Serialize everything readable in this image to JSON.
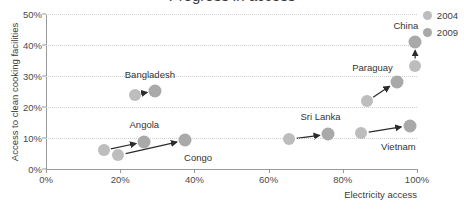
{
  "chart_data": {
    "type": "scatter",
    "title": "Progress in access",
    "xlabel": "Electricity access",
    "ylabel": "Access to clean cooking facilities",
    "xlim": [
      0,
      100
    ],
    "ylim": [
      0,
      50
    ],
    "xticks": [
      "0%",
      "20%",
      "40%",
      "60%",
      "80%",
      "100%"
    ],
    "xtick_values": [
      0,
      20,
      40,
      60,
      80,
      100
    ],
    "yticks": [
      "0%",
      "10%",
      "20%",
      "30%",
      "40%",
      "50%"
    ],
    "ytick_values": [
      0,
      10,
      20,
      30,
      40,
      50
    ],
    "grid": "horizontal-dotted",
    "legend_position": "top-right",
    "series": [
      {
        "name": "2004",
        "color": "#bdbdbd"
      },
      {
        "name": "2009",
        "color": "#a9a9a9"
      }
    ],
    "points": [
      {
        "country": "Angola",
        "x2004": 15.5,
        "y2004": 6.0,
        "x2009": 26.5,
        "y2009": 8.8,
        "label": "Angola",
        "label_x": 26.5,
        "label_y": 14.5
      },
      {
        "country": "Congo",
        "x2004": 19.5,
        "y2004": 4.4,
        "x2009": 37.5,
        "y2009": 9.3,
        "label": "Congo",
        "label_x": 41.0,
        "label_y": 4.0
      },
      {
        "country": "Bangladesh",
        "x2004": 24.0,
        "y2004": 24.0,
        "x2009": 29.5,
        "y2009": 25.2,
        "label": "Bangladesh",
        "label_x": 28.0,
        "label_y": 30.5
      },
      {
        "country": "Sri Lanka",
        "x2004": 65.5,
        "y2004": 9.6,
        "x2009": 76.0,
        "y2009": 11.2,
        "label": "Sri Lanka",
        "label_x": 74.0,
        "label_y": 17.0
      },
      {
        "country": "Vietnam",
        "x2004": 85.0,
        "y2004": 11.5,
        "x2009": 98.0,
        "y2009": 14.0,
        "label": "Vietnam",
        "label_x": 95.0,
        "label_y": 7.5
      },
      {
        "country": "Paraguay",
        "x2004": 86.5,
        "y2004": 21.8,
        "x2009": 94.5,
        "y2009": 28.2,
        "label": "Paraguay",
        "label_x": 88.0,
        "label_y": 33.0
      },
      {
        "country": "China",
        "x2004": 99.5,
        "y2004": 33.2,
        "x2009": 99.5,
        "y2009": 41.0,
        "label": "China",
        "label_x": 97.0,
        "label_y": 46.5
      }
    ]
  },
  "legend": {
    "items": [
      {
        "label": "2004",
        "color": "#bdbdbd"
      },
      {
        "label": "2009",
        "color": "#a9a9a9"
      }
    ]
  }
}
